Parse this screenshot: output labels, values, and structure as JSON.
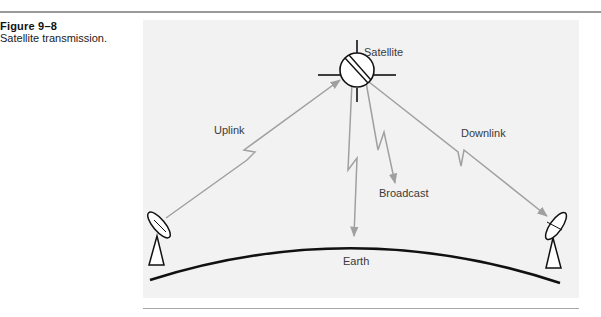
{
  "figure": {
    "number": "Figure 9–8",
    "caption": "Satellite transmission."
  },
  "diagram": {
    "labels": {
      "satellite": "Satellite",
      "uplink": "Uplink",
      "downlink": "Downlink",
      "broadcast": "Broadcast",
      "earth": "Earth"
    },
    "nodes": [
      "satellite",
      "ground-station-left",
      "ground-station-right"
    ],
    "links": [
      {
        "from": "ground-station-left",
        "to": "satellite",
        "label": "Uplink"
      },
      {
        "from": "satellite",
        "to": "ground-station-right",
        "label": "Downlink"
      },
      {
        "from": "satellite",
        "to": "earth",
        "label": "Broadcast"
      }
    ],
    "colors": {
      "panel": "#f2f2f2",
      "signal": "#a0a0a0",
      "stroke": "#111111"
    }
  }
}
